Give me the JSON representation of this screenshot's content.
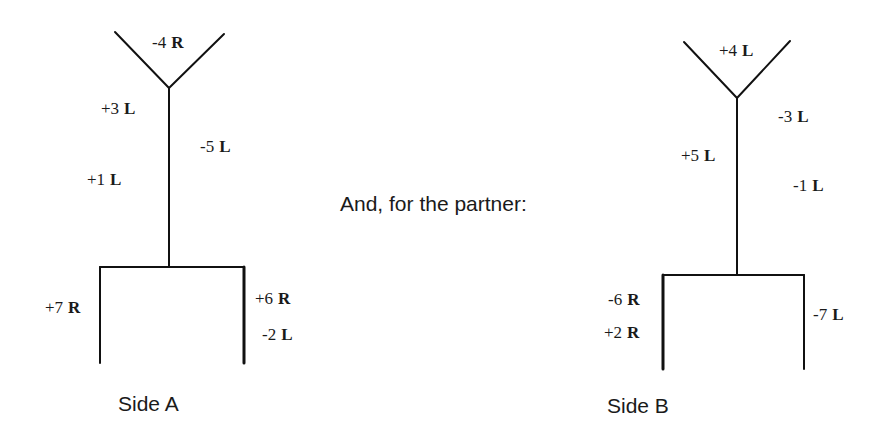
{
  "colors": {
    "line": "#111111",
    "text": "#1a1a1a",
    "background": "#ffffff"
  },
  "middle_text": "And, for the partner:",
  "side_a": {
    "caption": "Side A",
    "labels": {
      "top": {
        "num": "-4",
        "dir": "R"
      },
      "upper_left": {
        "num": "+3",
        "dir": "L"
      },
      "mid_right": {
        "num": "-5",
        "dir": "L"
      },
      "lower_left": {
        "num": "+1",
        "dir": "L"
      },
      "leg_left": {
        "num": "+7",
        "dir": "R"
      },
      "leg_right_1": {
        "num": "+6",
        "dir": "R"
      },
      "leg_right_2": {
        "num": "-2",
        "dir": "L"
      }
    }
  },
  "side_b": {
    "caption": "Side B",
    "labels": {
      "top": {
        "num": "+4",
        "dir": "L"
      },
      "upper_right": {
        "num": "-3",
        "dir": "L"
      },
      "mid_left": {
        "num": "+5",
        "dir": "L"
      },
      "lower_right": {
        "num": "-1",
        "dir": "L"
      },
      "leg_left_1": {
        "num": "-6",
        "dir": "R"
      },
      "leg_left_2": {
        "num": "+2",
        "dir": "R"
      },
      "leg_right": {
        "num": "-7",
        "dir": "L"
      }
    }
  }
}
